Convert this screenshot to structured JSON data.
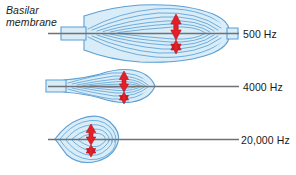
{
  "diagram": {
    "title_label": "Basilar\nmembrane",
    "width": 296,
    "height": 175,
    "background_color": "#ffffff",
    "membrane_line_color": "#6e7176",
    "envelope_fill_color": "#d8ecf8",
    "envelope_stroke_color": "#5b9fd4",
    "contour_color": "#5b9fd4",
    "arrow_color": "#e2202a",
    "arrow_stroke_color": "#b01117",
    "text_color": "#1a1a1a",
    "rows": [
      {
        "id": "row-500",
        "frequency_label": "500 Hz",
        "baseline_y": 33,
        "line_start_x": 48,
        "line_end_x": 237,
        "envelope_left_x": 84,
        "envelope_right_x": 229,
        "envelope_peak_x": 172,
        "envelope_amplitude": 27,
        "stem_left_x": 84,
        "stem_right_x": 234,
        "arrow_x": 176,
        "arrow_half_height": 18,
        "contour_count": 6,
        "shape": "lens"
      },
      {
        "id": "row-4000",
        "frequency_label": "4000 Hz",
        "baseline_y": 86,
        "line_start_x": 48,
        "line_end_x": 237,
        "envelope_left_x": 62,
        "envelope_right_x": 155,
        "envelope_peak_x": 122,
        "envelope_amplitude": 19,
        "stem_left_x": 62,
        "stem_right_x": 158,
        "arrow_x": 124,
        "arrow_half_height": 14,
        "contour_count": 5,
        "shape": "teardrop"
      },
      {
        "id": "row-20000",
        "frequency_label": "20,000 Hz",
        "baseline_y": 139,
        "line_start_x": 48,
        "line_end_x": 237,
        "envelope_left_x": 56,
        "envelope_right_x": 118,
        "envelope_peak_x": 95,
        "envelope_amplitude": 21,
        "stem_left_x": 56,
        "stem_right_x": 120,
        "arrow_x": 91,
        "arrow_half_height": 15,
        "contour_count": 4,
        "shape": "triangle"
      }
    ]
  }
}
